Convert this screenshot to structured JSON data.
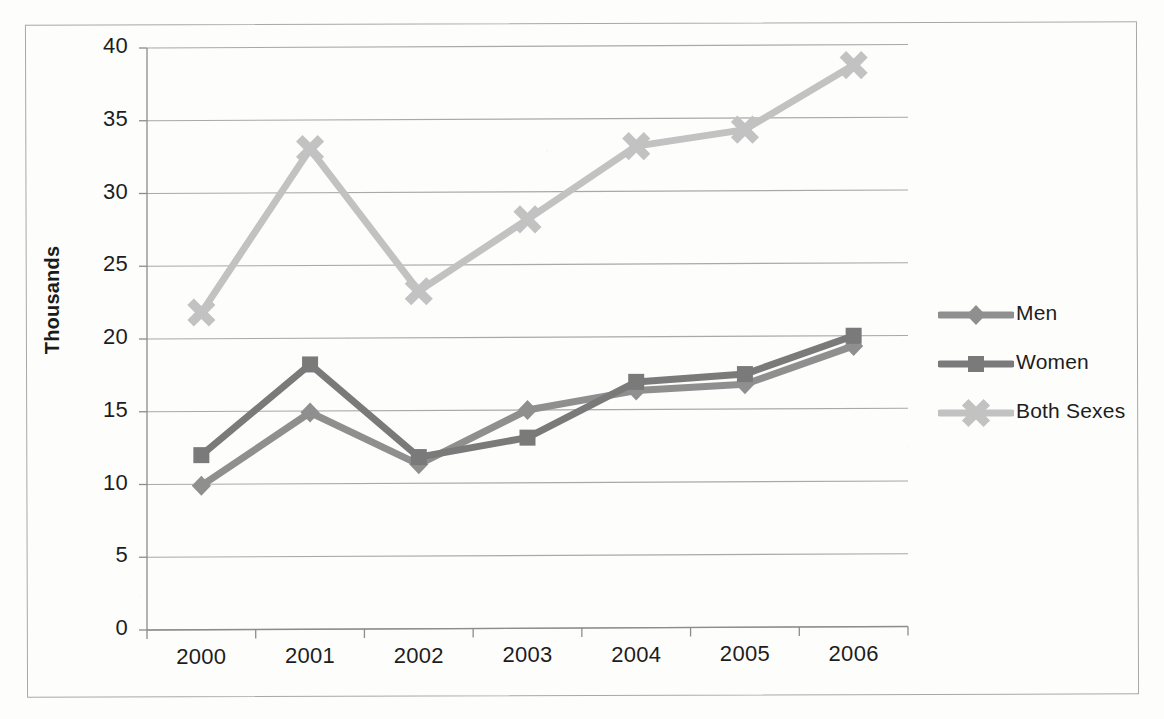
{
  "chart_data": {
    "type": "line",
    "title": "",
    "xlabel": "",
    "ylabel": "Thousands",
    "categories": [
      "2000",
      "2001",
      "2002",
      "2003",
      "2004",
      "2005",
      "2006"
    ],
    "x": [
      2000,
      2001,
      2002,
      2003,
      2004,
      2005,
      2006
    ],
    "ylim": [
      0,
      40
    ],
    "yticks": [
      0,
      5,
      10,
      15,
      20,
      25,
      30,
      35,
      40
    ],
    "ytick_labels": [
      "0",
      "5",
      "10",
      "15",
      "20",
      "25",
      "30",
      "35",
      "40"
    ],
    "grid": true,
    "legend_position": "right",
    "series": [
      {
        "name": "Men",
        "marker": "diamond",
        "color": "#8f8f8f",
        "values": [
          9.9,
          14.9,
          11.3,
          15.0,
          16.3,
          16.7,
          19.3
        ]
      },
      {
        "name": "Women",
        "marker": "square",
        "color": "#7a7a7a",
        "values": [
          12.0,
          18.2,
          11.8,
          13.1,
          16.9,
          17.4,
          20.0
        ]
      },
      {
        "name": "Both Sexes",
        "marker": "cross",
        "color": "#c2c2c2",
        "values": [
          21.8,
          33.0,
          23.2,
          28.1,
          33.1,
          34.2,
          38.6
        ]
      }
    ]
  },
  "axis": {
    "y_title": "Thousands",
    "y_labels": [
      "40",
      "35",
      "30",
      "25",
      "20",
      "15",
      "10",
      "5",
      "0"
    ],
    "x_labels": [
      "2000",
      "2001",
      "2002",
      "2003",
      "2004",
      "2005",
      "2006"
    ]
  },
  "legend": {
    "items": [
      {
        "label": "Men",
        "marker": "diamond-marker",
        "color": "#8f8f8f"
      },
      {
        "label": "Women",
        "marker": "square-marker",
        "color": "#7a7a7a"
      },
      {
        "label": "Both Sexes",
        "marker": "cross-marker",
        "color": "#c2c2c2"
      }
    ]
  },
  "colors": {
    "men": "#8f8f8f",
    "women": "#7a7a7a",
    "both_sexes": "#c2c2c2",
    "gridline": "#9a9a98",
    "axis": "#8c8c8a",
    "text": "#1d1d1d",
    "page_border": "#a8a8a6",
    "background": "#fdfdfc"
  }
}
